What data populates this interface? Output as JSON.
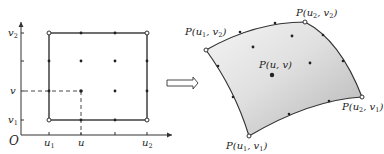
{
  "figure": {
    "left_panel": {
      "origin_label": "O",
      "u_ticks": [
        {
          "label": "u",
          "sub": "1"
        },
        {
          "label": "u",
          "sub": ""
        },
        {
          "label": "u",
          "sub": "2"
        }
      ],
      "v_ticks": [
        {
          "label": "v",
          "sub": "2"
        },
        {
          "label": "v",
          "sub": ""
        },
        {
          "label": "v",
          "sub": "1"
        }
      ]
    },
    "arrow": "implies-arrow",
    "right_panel": {
      "corner_labels": {
        "p_u1_v2": {
          "main": "P(u",
          "s1": "1",
          "mid": ", v",
          "s2": "2",
          "end": ")"
        },
        "p_u2_v2": {
          "main": "P(u",
          "s1": "2",
          "mid": ", v",
          "s2": "2",
          "end": ")"
        },
        "p_u2_v1": {
          "main": "P(u",
          "s1": "2",
          "mid": ", v",
          "s2": "1",
          "end": ")"
        },
        "p_u1_v1": {
          "main": "P(u",
          "s1": "1",
          "mid": ", v",
          "s2": "1",
          "end": ")"
        }
      },
      "center_label": "P(u, v)"
    },
    "colors": {
      "line": "#333333",
      "surface_light": "#f2f2f2",
      "surface_dark": "#b8b8b8"
    }
  }
}
